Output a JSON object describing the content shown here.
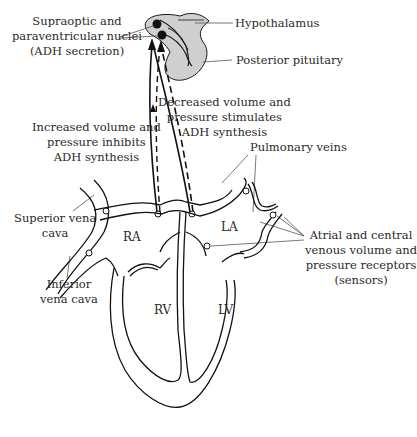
{
  "labels": {
    "supraoptic": [
      "Supraoptic and",
      "paraventricular nuclei",
      "(ADH secretion)"
    ],
    "hypothalamus": "Hypothalamus",
    "posterior_pituitary": "Posterior pituitary",
    "decreased": [
      "Decreased volume and",
      "pressure stimulates",
      "ADH synthesis"
    ],
    "increased": [
      "Increased volume and",
      "pressure inhibits",
      "ADH synthesis"
    ],
    "pulmonary_veins": "Pulmonary veins",
    "superior_vena_cava": [
      "Superior vena",
      "cava"
    ],
    "inferior_vena_cava": [
      "Inferior",
      "vena cava"
    ],
    "receptors": [
      "Atrial and central",
      "venous volume and",
      "pressure receptors",
      "(sensors)"
    ],
    "chambers": {
      "ra": "RA",
      "la": "LA",
      "rv": "RV",
      "lv": "LV"
    }
  },
  "colors": {
    "line": "#1a1a1a",
    "brain_fill": "#cfcfcf",
    "leader": "#555555"
  }
}
